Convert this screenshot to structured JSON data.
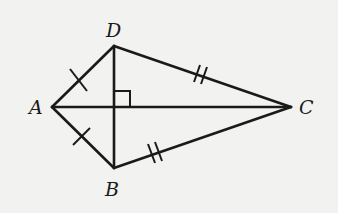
{
  "diagram": {
    "type": "kite",
    "vertices": {
      "A": {
        "label": "A",
        "x": 52,
        "y": 107
      },
      "B": {
        "label": "B",
        "x": 114,
        "y": 168
      },
      "C": {
        "label": "C",
        "x": 291,
        "y": 107
      },
      "D": {
        "label": "D",
        "x": 114,
        "y": 46
      }
    },
    "segments": [
      "AD",
      "AB",
      "DC",
      "BC",
      "AC",
      "DB"
    ],
    "marks": {
      "single_tick": [
        "AD",
        "AB"
      ],
      "double_tick": [
        "DC",
        "BC"
      ],
      "right_angle": "AC ⊥ DB"
    },
    "colors": {
      "line": "#1a1a1a",
      "background": "#f2f2f0"
    }
  }
}
